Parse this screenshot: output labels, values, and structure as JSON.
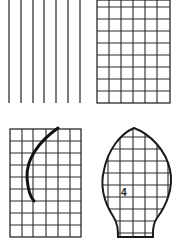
{
  "figure": {
    "panels": [
      {
        "id": "vertical-lines",
        "description": "Parallel vertical lines"
      },
      {
        "id": "square-grid",
        "description": "Rectangular square grid"
      },
      {
        "id": "grid-with-curve",
        "description": "Grid with a curved line"
      },
      {
        "id": "leaf-shape-grid",
        "description": "Leaf/bud shaped outline filled with grid",
        "label": "4"
      }
    ],
    "colors": {
      "ink": "#2a2a2a",
      "background": "#ffffff"
    }
  }
}
